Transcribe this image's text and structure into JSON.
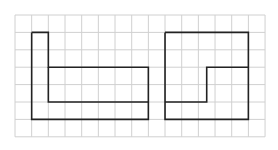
{
  "diagram": {
    "type": "grid-figures",
    "grid": {
      "origin_x": 15,
      "origin_y": 15,
      "columns": 15,
      "rows": 7,
      "cell_width": 16.67,
      "cell_height": 17.4,
      "line_color": "#d0d0d0",
      "line_width": 1
    },
    "shape_style": {
      "stroke": "#222222",
      "stroke_width": 1.6
    },
    "shapes": [
      {
        "name": "left-figure",
        "paths": [
          [
            [
              1,
              1
            ],
            [
              2,
              1
            ],
            [
              2,
              3
            ],
            [
              8,
              3
            ],
            [
              8,
              6
            ],
            [
              1,
              6
            ],
            [
              1,
              1
            ]
          ],
          [
            [
              2,
              3
            ],
            [
              2,
              5
            ],
            [
              8,
              5
            ]
          ]
        ]
      },
      {
        "name": "right-figure",
        "paths": [
          [
            [
              9,
              1
            ],
            [
              14,
              1
            ],
            [
              14,
              6
            ],
            [
              9,
              6
            ],
            [
              9,
              1
            ]
          ],
          [
            [
              14,
              3
            ],
            [
              11.5,
              3
            ],
            [
              11.5,
              5
            ],
            [
              9,
              5
            ]
          ]
        ]
      }
    ]
  }
}
